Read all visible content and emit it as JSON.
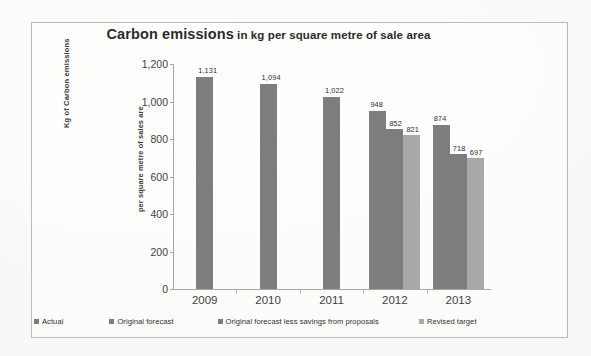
{
  "frame": {
    "border_color": "#b9b9b9"
  },
  "chart_data": {
    "type": "bar",
    "title": "Carbon emissions in kg per square metre of sale area",
    "title_main": "Carbon emissions",
    "title_sub": " in kg per square metre of sale area",
    "xlabel": "",
    "ylabel": "Kg of Carbon emissions",
    "ylabel_inner": "per square metre of sales are",
    "categories": [
      "2009",
      "2010",
      "2011",
      "2012",
      "2013"
    ],
    "ylim": [
      0,
      1200
    ],
    "ytick_values": [
      0,
      200,
      400,
      600,
      800,
      1000,
      1200
    ],
    "ytick_labels": [
      "0",
      "200",
      "400",
      "600",
      "800",
      "1,000",
      "1,200"
    ],
    "grid": false,
    "legend_position": "bottom",
    "series": [
      {
        "name": "Actual",
        "color": "#7e7e7e",
        "values": [
          1131,
          1094,
          1022,
          948,
          874
        ],
        "labels": [
          "1,131",
          "1,094",
          "1,022",
          "948",
          "874"
        ]
      },
      {
        "name": "Original forecast",
        "color": "#7e7e7e",
        "values": [
          null,
          null,
          null,
          null,
          null
        ],
        "labels": [
          "",
          "",
          "",
          "",
          ""
        ]
      },
      {
        "name": "Original forecast less savings from proposals",
        "color": "#7d7d7d",
        "values": [
          null,
          null,
          null,
          852,
          718
        ],
        "labels": [
          "",
          "",
          "",
          "852",
          "718"
        ]
      },
      {
        "name": "Revised target",
        "color": "#a9a9a9",
        "values": [
          null,
          null,
          null,
          821,
          697
        ],
        "labels": [
          "",
          "",
          "",
          "821",
          "697"
        ]
      }
    ]
  },
  "legend": [
    {
      "label": "Actual",
      "color": "#7e7e7e"
    },
    {
      "label": "Original forecast",
      "color": "#7e7e7e"
    },
    {
      "label": "Original forecast less savings from proposals",
      "color": "#7d7d7d"
    },
    {
      "label": "Revised target",
      "color": "#a9a9a9"
    }
  ]
}
